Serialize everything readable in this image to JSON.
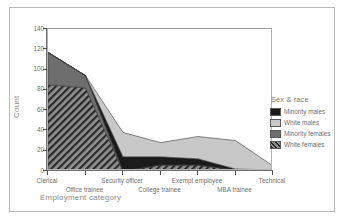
{
  "axis": {
    "x_title": "Employment category",
    "y_title": "Count",
    "y_ticks": [
      "0",
      "20",
      "40",
      "60",
      "80",
      "100",
      "120",
      "140"
    ]
  },
  "legend": {
    "title": "Sex & race",
    "items": [
      {
        "label": "Minority males",
        "swatch": "minority-males",
        "color": "#1b1b1b"
      },
      {
        "label": "White males",
        "swatch": "white-males",
        "color": "#c8c8c8"
      },
      {
        "label": "Minority females",
        "swatch": "minority-females",
        "color": "#6e6e6e"
      },
      {
        "label": "White females",
        "swatch": "white-females",
        "color": "#8f8f8f"
      }
    ]
  },
  "chart_data": {
    "type": "area",
    "stacked": true,
    "title": "",
    "xlabel": "Employment category",
    "ylabel": "Count",
    "ylim": [
      0,
      140
    ],
    "ytick_step": 20,
    "grid": false,
    "legend_position": "right",
    "legend_title": "Sex & race",
    "categories": [
      "Clerical",
      "Office trainee",
      "Security officer",
      "College trainee",
      "Exempt employee",
      "MBA trainee",
      "Technical"
    ],
    "series": [
      {
        "name": "White females",
        "color": "#8f8f8f",
        "pattern": "diagonal-hatch",
        "values": [
          85,
          82,
          0,
          6,
          6,
          1,
          1
        ]
      },
      {
        "name": "Minority females",
        "color": "#6e6e6e",
        "pattern": "solid",
        "values": [
          32,
          12,
          0,
          0,
          0,
          0,
          0
        ]
      },
      {
        "name": "Minority males",
        "color": "#1b1b1b",
        "pattern": "solid",
        "values": [
          0,
          0,
          14,
          8,
          6,
          1,
          0
        ]
      },
      {
        "name": "White males",
        "color": "#c8c8c8",
        "pattern": "solid",
        "values": [
          0,
          0,
          24,
          14,
          22,
          28,
          4
        ]
      }
    ],
    "totals": [
      117,
      94,
      38,
      28,
      34,
      30,
      5
    ]
  }
}
